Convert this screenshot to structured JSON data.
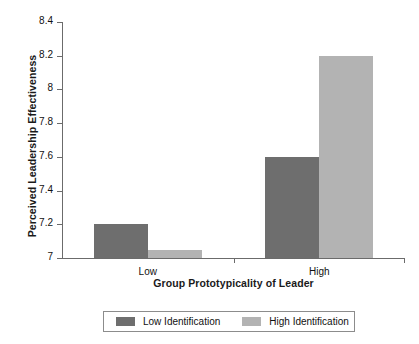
{
  "chart_data": {
    "type": "bar",
    "title": "",
    "xlabel": "Group Prototypicality of Leader",
    "ylabel": "Perceived Leadership Effectiveness",
    "categories": [
      "Low",
      "High"
    ],
    "series": [
      {
        "name": "Low Identification",
        "color": "#6e6e6e",
        "values": [
          7.2,
          7.6
        ]
      },
      {
        "name": "High Identification",
        "color": "#b3b3b3",
        "values": [
          7.05,
          8.2
        ]
      }
    ],
    "ylim": [
      7,
      8.4
    ],
    "yticks": [
      7,
      7.2,
      7.4,
      7.6,
      7.8,
      8,
      8.2,
      8.4
    ],
    "ytick_labels": [
      "7",
      "7.2",
      "7.4",
      "7.6",
      "7.8",
      "8",
      "8.2",
      "8.4"
    ],
    "grid": false,
    "legend_position": "bottom",
    "legend_entries": [
      "Low Identification",
      "High Identification"
    ],
    "axis_color": "#6b6b6b",
    "background": "#ffffff"
  }
}
